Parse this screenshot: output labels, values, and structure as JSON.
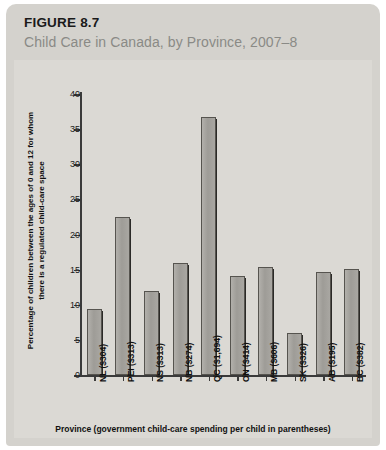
{
  "figure": {
    "number": "FIGURE 8.7",
    "subtitle": "Child Care in Canada, by Province, 2007–8"
  },
  "chart_data": {
    "type": "bar",
    "title": "Child Care in Canada, by Province, 2007–8",
    "xlabel": "Province (government child-care spending per child in parentheses)",
    "ylabel": "Percentage of children between the ages of 0 and 12 for whom there is a regulated child-care space",
    "ylim": [
      0,
      40
    ],
    "yticks": [
      0,
      5,
      10,
      15,
      20,
      25,
      30,
      35,
      40
    ],
    "grid": false,
    "legend": null,
    "categories": [
      "NL ($304)",
      "PEI ($313)",
      "NS ($313)",
      "NB ($274)",
      "QC ($1,694)",
      "ON ($414)",
      "MB ($606)",
      "SK ($326)",
      "AB ($195)",
      "BC ($382)"
    ],
    "values": [
      9.4,
      22.5,
      12.0,
      16.0,
      36.7,
      14.1,
      15.4,
      6.0,
      14.6,
      15.1
    ],
    "bar_color": "#a09e99",
    "axis_color": "#3a3a3a",
    "panel_color": "#dbd9d4"
  },
  "colors": {
    "card_background": "#d4d2cd",
    "panel_background": "#dbd9d4",
    "subtitle": "#8a8a86",
    "text": "#1a1a1a"
  }
}
